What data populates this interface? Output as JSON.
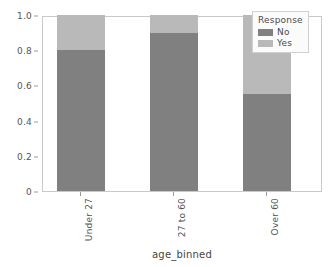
{
  "chart_data": {
    "type": "bar",
    "subtype": "stacked-100-percent",
    "title": "",
    "xlabel": "age_binned",
    "ylabel": "",
    "categories": [
      "Under 27",
      "27 to 60",
      "Over 60"
    ],
    "series": [
      {
        "name": "No",
        "values": [
          0.8,
          0.9,
          0.55
        ],
        "color": "#808080"
      },
      {
        "name": "Yes",
        "values": [
          0.2,
          0.1,
          0.45
        ],
        "color": "#b9b9b9"
      }
    ],
    "ylim": [
      0,
      1.0
    ],
    "yticks": [
      "0",
      "0.2",
      "0.4",
      "0.6",
      "0.8",
      "1.0"
    ],
    "ytick_values": [
      0,
      0.2,
      0.4,
      0.6,
      0.8,
      1.0
    ],
    "grid": false,
    "legend": {
      "title": "Response",
      "position": "upper right",
      "entries": [
        "No",
        "Yes"
      ]
    }
  },
  "legend": {
    "title": "Response",
    "items": [
      {
        "label": "No",
        "color": "#808080"
      },
      {
        "label": "Yes",
        "color": "#b9b9b9"
      }
    ]
  },
  "axes": {
    "x_title": "age_binned",
    "x_tick_labels": [
      "Under 27",
      "27 to 60",
      "Over 60"
    ],
    "y_tick_labels": [
      "1.0",
      "0.8",
      "0.6",
      "0.4",
      "0.2",
      "0"
    ]
  },
  "colors": {
    "no": "#808080",
    "yes": "#b9b9b9",
    "axis": "#c9c9c9",
    "text": "#555555",
    "background": "#ffffff"
  }
}
